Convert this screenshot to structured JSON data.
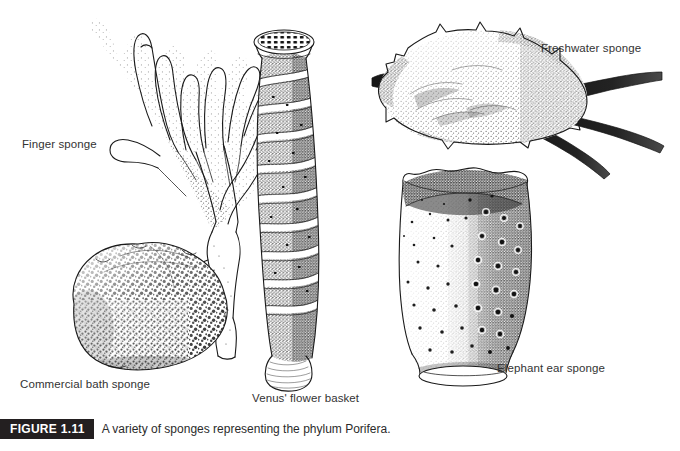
{
  "figure": {
    "badge": "FIGURE 1.11",
    "caption": "A variety of sponges representing the phylum Porifera.",
    "background_color": "#ffffff",
    "badge_color": "#231f20",
    "ink_color": "#1a1a1a",
    "label_color": "#333333"
  },
  "specimens": [
    {
      "id": "finger-sponge",
      "label": "Finger sponge",
      "form": "branching antler-like digitate colony with stippled shading"
    },
    {
      "id": "commercial-bath-sponge",
      "label": "Commercial bath sponge",
      "form": "rounded irregular mass with dense network of small pores"
    },
    {
      "id": "venus-flower-basket",
      "label": "Venus' flower basket",
      "form": "tall curved tube with spiral ridges, latticed osculum at top, ribbed basal tuft"
    },
    {
      "id": "freshwater-sponge",
      "label": "Freshwater sponge",
      "form": "encrusting lobed mass growing on a dark forked twig"
    },
    {
      "id": "elephant-ear-sponge",
      "label": "Elephant ear sponge",
      "form": "vase shaped cup with wavy rim, scattered oscula, narrow stalk and basal pad"
    }
  ]
}
